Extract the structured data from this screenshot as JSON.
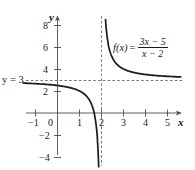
{
  "chart_data": {
    "type": "line",
    "title": "",
    "subtitle": "",
    "xlabel": "x",
    "ylabel": "y",
    "xlim": [
      -1.5,
      5.8
    ],
    "ylim": [
      -4.8,
      9.2
    ],
    "grid": false,
    "legend_position": "none",
    "function_expression": "f(x) = (3x - 5)/(x - 2)",
    "function_label": {
      "name": "f(x)",
      "equals": "=",
      "numerator": "3x − 5",
      "denominator": "x − 2"
    },
    "xticks": [
      -1,
      0,
      1,
      2,
      3,
      4,
      5
    ],
    "xtick_labels": [
      "−1",
      "0",
      "1",
      "2",
      "3",
      "4",
      "5"
    ],
    "yticks": [
      -4,
      -2,
      2,
      4,
      6,
      8
    ],
    "ytick_labels": [
      "−4",
      "−2",
      "2",
      "4",
      "6",
      "8"
    ],
    "asymptotes": [
      {
        "kind": "horizontal",
        "value": 3,
        "label": "y = 3",
        "style": "dashed"
      },
      {
        "kind": "vertical",
        "value": 2,
        "label": "x = 2",
        "style": "dashed"
      }
    ],
    "x_intercept": 1.667,
    "y_intercept": 2.5,
    "series": [
      {
        "name": "left-branch",
        "description": "branch for x < 2, approaches y=3 from below as x decreases, falls to minus infinity as x approaches 2 from the left",
        "x": [
          -1.5,
          -1.0,
          -0.5,
          0.0,
          0.5,
          1.0,
          1.3,
          1.5,
          1.6,
          1.7,
          1.75,
          1.8,
          1.85,
          1.88,
          1.9
        ],
        "y": [
          2.71,
          2.67,
          2.6,
          2.5,
          2.33,
          2.0,
          1.57,
          1.0,
          0.5,
          -0.33,
          -1.0,
          -2.0,
          -3.67,
          -5.33,
          -7.0
        ]
      },
      {
        "name": "right-branch",
        "description": "branch for x > 2, descends from plus infinity near x=2 and flattens toward y=3",
        "x": [
          2.12,
          2.2,
          2.3,
          2.5,
          2.75,
          3.0,
          3.5,
          4.0,
          4.5,
          5.0,
          5.3
        ],
        "y": [
          11.33,
          8.0,
          6.33,
          5.0,
          4.33,
          4.0,
          3.67,
          3.5,
          3.4,
          3.33,
          3.3
        ]
      }
    ],
    "colors": {
      "curve": "#1a1a1a",
      "axis": "#4d4d4d",
      "asymptote": "#666666",
      "text": "#1a1a1a",
      "background": "#ffffff"
    }
  },
  "labels": {
    "y_axis_name": "y",
    "x_axis_name": "x",
    "horizontal_asymptote_label": "y = 3"
  }
}
